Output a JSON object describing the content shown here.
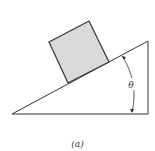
{
  "figure": {
    "caption": "(a)",
    "angle_label": "θ",
    "colors": {
      "line": "#333333",
      "block_fill": "#d9d9d9",
      "background": "#ffffff"
    }
  }
}
